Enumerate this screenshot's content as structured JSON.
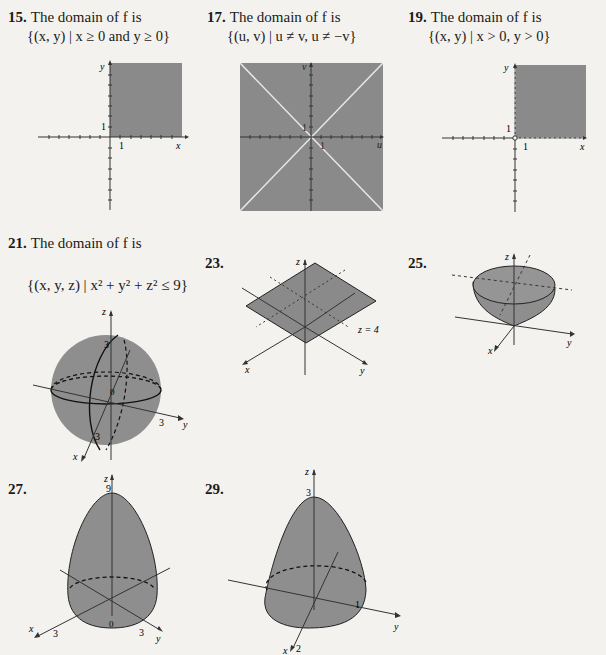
{
  "colors": {
    "background": "#f3f2ee",
    "region_fill": "#8a8a8a",
    "surface_fill": "#9a9a9a",
    "ink": "#1a1a1a",
    "white_line": "#e8e8e8"
  },
  "problems": [
    {
      "number": "15.",
      "statement": "The domain of f is",
      "set": "{(x, y) | x ≥ 0 and y ≥ 0}",
      "figure": {
        "type": "2d-region",
        "x_axis": "x",
        "y_axis": "y",
        "x_tick_label": "1",
        "y_tick_label": "1",
        "region": "first quadrant including axes"
      }
    },
    {
      "number": "17.",
      "statement": "The domain of f is",
      "set": "{(u, v) | u ≠ v, u ≠ −v}",
      "figure": {
        "type": "2d-region",
        "x_axis": "u",
        "y_axis": "v",
        "x_tick_label": "1",
        "y_tick_label": "1",
        "region": "whole plane except lines v = u and v = −u"
      }
    },
    {
      "number": "19.",
      "statement": "The domain of f is",
      "set": "{(x, y) | x > 0, y > 0}",
      "figure": {
        "type": "2d-region",
        "x_axis": "x",
        "y_axis": "y",
        "x_tick_label": "1",
        "y_tick_label": "1",
        "region": "open first quadrant (axes dashed, origin open)"
      }
    },
    {
      "number": "21.",
      "statement": "The domain of f is",
      "set": "{(x, y, z) | x² + y² + z² ≤ 9}",
      "figure": {
        "type": "3d-solid",
        "shape": "ball",
        "axes": [
          "x",
          "y",
          "z"
        ],
        "labels": [
          "3",
          "3",
          "3"
        ]
      }
    },
    {
      "number": "23.",
      "statement": "",
      "figure": {
        "type": "3d-surface",
        "shape": "plane",
        "axes": [
          "x",
          "y",
          "z"
        ],
        "annotation": "z = 4"
      }
    },
    {
      "number": "25.",
      "statement": "",
      "figure": {
        "type": "3d-surface",
        "shape": "paraboloid opening up",
        "axes": [
          "x",
          "y",
          "z"
        ]
      }
    },
    {
      "number": "27.",
      "statement": "",
      "figure": {
        "type": "3d-surface",
        "shape": "paraboloid opening down",
        "axes": [
          "x",
          "y",
          "z"
        ],
        "labels": {
          "z": "9",
          "x": "3",
          "y": "3",
          "origin": "0"
        }
      }
    },
    {
      "number": "29.",
      "statement": "",
      "figure": {
        "type": "3d-surface",
        "shape": "elliptic paraboloid opening down",
        "axes": [
          "x",
          "y",
          "z"
        ],
        "labels": {
          "z": "3",
          "x": "2",
          "y": "1"
        }
      }
    }
  ]
}
